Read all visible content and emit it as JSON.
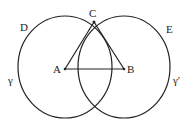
{
  "diagram": {
    "points": {
      "A": {
        "label": "A",
        "x": 65,
        "y": 69
      },
      "B": {
        "label": "B",
        "x": 124,
        "y": 69
      },
      "C": {
        "label": "C",
        "x": 93,
        "y": 22
      }
    },
    "circle_labels": {
      "D": "D",
      "E": "E",
      "gamma": "γ",
      "gamma_prime": "γ′"
    },
    "colors": {
      "stroke": "#222222",
      "background": "#ffffff"
    }
  }
}
